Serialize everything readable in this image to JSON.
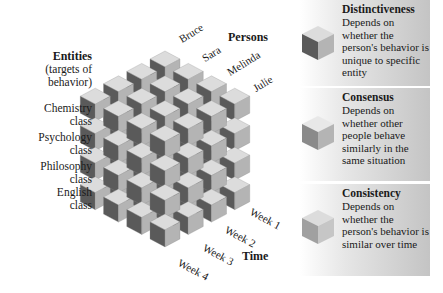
{
  "diagram": {
    "type": "covariation-cube",
    "grid": {
      "persons": 4,
      "entities": 4,
      "times": 4
    },
    "colors": {
      "cube_top": "#dcdcdc",
      "cube_left": "#5a5a5a",
      "cube_right": "#b4b4b4",
      "cube_edge": "#8c8c8c",
      "panel_gradient_end": "#c4c4c4"
    }
  },
  "axes": {
    "persons": {
      "title": "Persons",
      "labels": [
        "Bruce",
        "Sara",
        "Melinda",
        "Julie"
      ]
    },
    "entities": {
      "title": "Entities",
      "subtitle_line1": "(targets of",
      "subtitle_line2": "behavior)",
      "labels": [
        {
          "line1": "Chemistry",
          "line2": "class"
        },
        {
          "line1": "Psychology",
          "line2": "class"
        },
        {
          "line1": "Philosophy",
          "line2": "class"
        },
        {
          "line1": "English",
          "line2": "class"
        }
      ]
    },
    "time": {
      "title": "Time",
      "labels": [
        "Week 1",
        "Week 2",
        "Week 3",
        "Week 4"
      ]
    }
  },
  "panels": [
    {
      "title": "Distinctiveness",
      "description": "Depends on whether the person's behavior is unique to specific entity",
      "cube_face": "left"
    },
    {
      "title": "Consensus",
      "description": "Depends on whether other people behave similarly in the same situation",
      "cube_face": "top"
    },
    {
      "title": "Consistency",
      "description": "Depends on whether the person's behavior is similar over time",
      "cube_face": "right"
    }
  ]
}
